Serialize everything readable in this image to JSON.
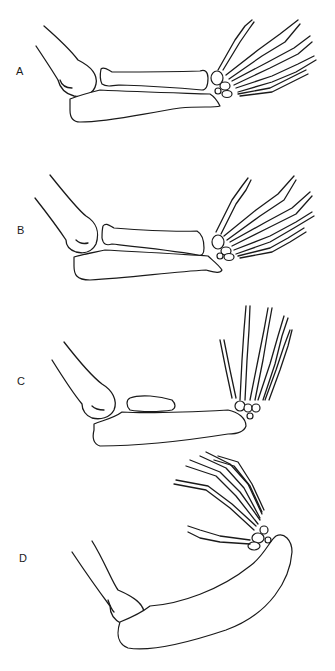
{
  "figure": {
    "panels": [
      {
        "id": "A",
        "label": "A"
      },
      {
        "id": "B",
        "label": "B"
      },
      {
        "id": "C",
        "label": "C"
      },
      {
        "id": "D",
        "label": "D"
      }
    ]
  },
  "colors": {
    "background": "#ffffff",
    "line": "#1a1a1a"
  }
}
